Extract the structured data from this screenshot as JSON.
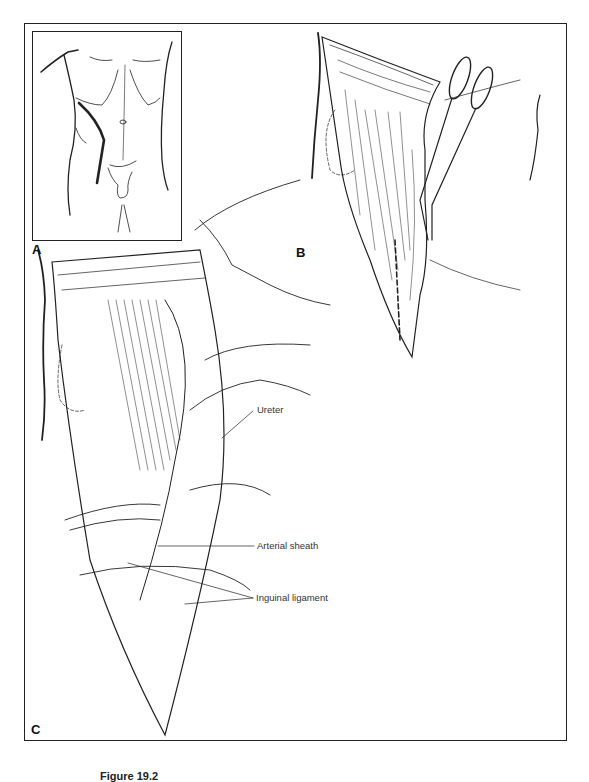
{
  "figure": {
    "panels": [
      {
        "id": "A",
        "label": "A",
        "description": "Torso outline with incision line"
      },
      {
        "id": "B",
        "label": "B",
        "description": "Incision opened with scissors dividing muscle"
      },
      {
        "id": "C",
        "label": "C",
        "description": "Exposure of retroperitoneal structures"
      }
    ],
    "annotations": [
      {
        "id": "ureter",
        "text": "Ureter"
      },
      {
        "id": "arterial-sheath",
        "text": "Arterial sheath"
      },
      {
        "id": "inguinal-ligament",
        "text": "Inguinal ligament"
      }
    ],
    "caption": "Figure 19.2"
  }
}
